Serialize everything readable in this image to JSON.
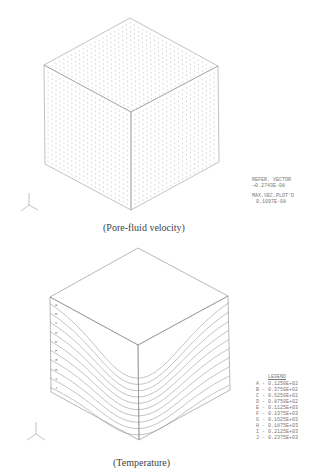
{
  "figure1": {
    "caption": "(Pore-fluid velocity)",
    "ref_vector_title": "REFER. VECTOR",
    "ref_vector_value": "⟶0.2743E-08",
    "max_vec_title": "MAX.VEC.PLOT'D",
    "max_vec_value": "0.1097E-08",
    "axes": {
      "x": "X",
      "y": "Y",
      "z": "Z"
    }
  },
  "figure2": {
    "caption": "(Temperature)",
    "legend_title": "LEGEND",
    "legend": [
      {
        "label": "A",
        "value": "0.1250E+02"
      },
      {
        "label": "B",
        "value": "0.3750E+02"
      },
      {
        "label": "C",
        "value": "0.6250E+02"
      },
      {
        "label": "D",
        "value": "0.8750E+02"
      },
      {
        "label": "E",
        "value": "0.1125E+03"
      },
      {
        "label": "F",
        "value": "0.1375E+03"
      },
      {
        "label": "G",
        "value": "0.1625E+03"
      },
      {
        "label": "H",
        "value": "0.1875E+03"
      },
      {
        "label": "I",
        "value": "0.2125E+03"
      },
      {
        "label": "J",
        "value": "0.2375E+03"
      }
    ],
    "axes": {
      "x": "X",
      "y": "Y",
      "z": "Z"
    }
  },
  "colors": {
    "line": "#888888",
    "arrows": "#aaaaaa",
    "text": "#444444"
  }
}
